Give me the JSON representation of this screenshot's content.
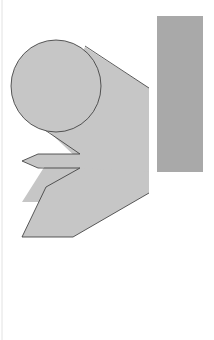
{
  "diagram": {
    "type": "solar-heat-through-glass",
    "colors": {
      "beam": "#c6c6c6",
      "pane": "#a9a9a9",
      "outline": "#333333",
      "text": "#3a3a3a",
      "border": "#e2e2e2"
    },
    "labels": {
      "transmitted": "Transmitted",
      "solar_pct": "100%",
      "solar_heat": "Solar heat",
      "reflected": "Reflected",
      "absorbed_left_1": "Absorbed and",
      "absorbed_left_2": "re-radiated",
      "absorbed_right_1": "Absorbed",
      "absorbed_right_2": "and",
      "absorbed_right_3": "re-radiated",
      "insulating_1": "Insulating",
      "insulating_2": "glass or film"
    }
  }
}
